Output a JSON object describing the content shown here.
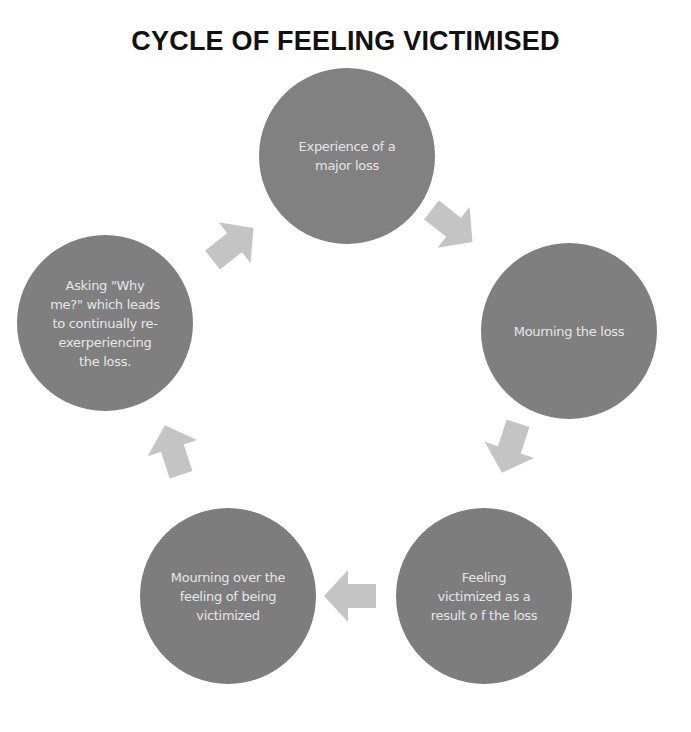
{
  "title": "CYCLE OF FEELING VICTIMISED",
  "colors": {
    "node_fill": "#808080",
    "node_text": "#e6e6e6",
    "arrow_fill": "#c4c4c4",
    "title": "#111111",
    "background": "#ffffff"
  },
  "nodes": [
    {
      "id": "n1",
      "label": "Experience of a major loss"
    },
    {
      "id": "n2",
      "label": "Mourning the loss"
    },
    {
      "id": "n3",
      "label": "Feeling victimized as a result o f the loss"
    },
    {
      "id": "n4",
      "label": "Mourning over the feeling of being victimized"
    },
    {
      "id": "n5",
      "label": "Asking \"Why me?\" which leads to continually re-exerperiencing the loss."
    }
  ],
  "edges": [
    {
      "from": "n1",
      "to": "n2"
    },
    {
      "from": "n2",
      "to": "n3"
    },
    {
      "from": "n3",
      "to": "n4"
    },
    {
      "from": "n4",
      "to": "n5"
    },
    {
      "from": "n5",
      "to": "n1"
    }
  ]
}
